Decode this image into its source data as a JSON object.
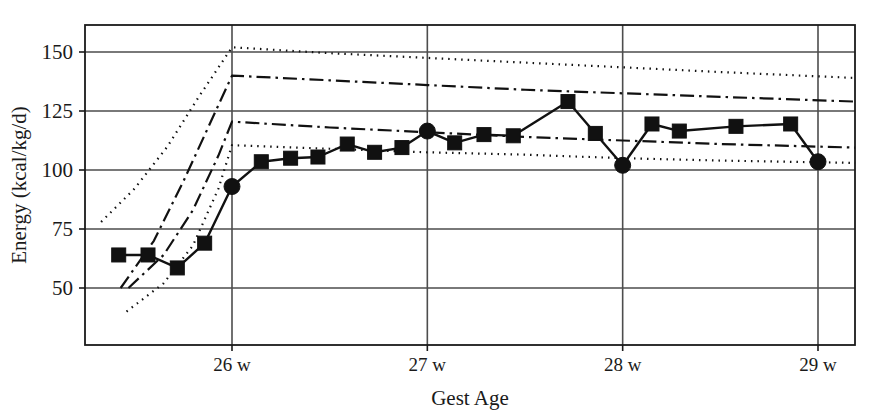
{
  "chart_data": {
    "type": "line",
    "title": "",
    "xlabel": "Gest Age",
    "ylabel": "Energy (kcal/kg/d)",
    "xlim": [
      25.25,
      29.19
    ],
    "ylim": [
      38,
      158
    ],
    "grid": true,
    "legend_position": "none",
    "x_ticks": [
      26,
      27,
      28,
      29
    ],
    "x_tick_labels": [
      "26 w",
      "27 w",
      "28 w",
      "29 w"
    ],
    "y_ticks": [
      50,
      75,
      100,
      125,
      150
    ],
    "y_tick_labels": [
      "50",
      "75",
      "100",
      "125",
      "150"
    ],
    "series": [
      {
        "name": "Measured energy intake",
        "style": "solid",
        "marker": "square-and-circle",
        "note": "circle markers fall on whole-week gridlines, squares elsewhere",
        "points": [
          {
            "x": 25.42,
            "y": 64.0,
            "marker": "square"
          },
          {
            "x": 25.57,
            "y": 64.0,
            "marker": "square"
          },
          {
            "x": 25.72,
            "y": 58.5,
            "marker": "square"
          },
          {
            "x": 25.86,
            "y": 69.0,
            "marker": "square"
          },
          {
            "x": 26.0,
            "y": 93.0,
            "marker": "circle"
          },
          {
            "x": 26.15,
            "y": 103.5,
            "marker": "square"
          },
          {
            "x": 26.3,
            "y": 105.0,
            "marker": "square"
          },
          {
            "x": 26.44,
            "y": 105.5,
            "marker": "square"
          },
          {
            "x": 26.59,
            "y": 111.0,
            "marker": "square"
          },
          {
            "x": 26.73,
            "y": 107.5,
            "marker": "square"
          },
          {
            "x": 26.87,
            "y": 109.5,
            "marker": "square"
          },
          {
            "x": 27.0,
            "y": 116.5,
            "marker": "circle"
          },
          {
            "x": 27.14,
            "y": 111.5,
            "marker": "square"
          },
          {
            "x": 27.29,
            "y": 115.0,
            "marker": "square"
          },
          {
            "x": 27.44,
            "y": 114.5,
            "marker": "square"
          },
          {
            "x": 27.72,
            "y": 129.0,
            "marker": "square"
          },
          {
            "x": 27.86,
            "y": 115.5,
            "marker": "square"
          },
          {
            "x": 28.0,
            "y": 102.0,
            "marker": "circle"
          },
          {
            "x": 28.15,
            "y": 119.5,
            "marker": "square"
          },
          {
            "x": 28.29,
            "y": 116.5,
            "marker": "square"
          },
          {
            "x": 28.58,
            "y": 118.5,
            "marker": "square"
          },
          {
            "x": 28.86,
            "y": 119.5,
            "marker": "square"
          },
          {
            "x": 29.0,
            "y": 103.5,
            "marker": "circle"
          }
        ]
      },
      {
        "name": "Upper reference (outer)",
        "style": "dotted",
        "marker": "none",
        "points": [
          {
            "x": 25.33,
            "y": 78.0
          },
          {
            "x": 25.5,
            "y": 92.0
          },
          {
            "x": 25.67,
            "y": 110.0
          },
          {
            "x": 25.83,
            "y": 131.0
          },
          {
            "x": 26.0,
            "y": 152.0
          },
          {
            "x": 26.5,
            "y": 149.5
          },
          {
            "x": 27.0,
            "y": 147.5
          },
          {
            "x": 27.5,
            "y": 145.5
          },
          {
            "x": 28.0,
            "y": 143.5
          },
          {
            "x": 28.5,
            "y": 141.5
          },
          {
            "x": 29.19,
            "y": 139.0
          }
        ]
      },
      {
        "name": "Upper reference (inner)",
        "style": "dash-dot",
        "marker": "none",
        "points": [
          {
            "x": 25.43,
            "y": 50.0
          },
          {
            "x": 25.6,
            "y": 70.0
          },
          {
            "x": 25.75,
            "y": 95.0
          },
          {
            "x": 25.9,
            "y": 122.0
          },
          {
            "x": 26.0,
            "y": 140.0
          },
          {
            "x": 26.5,
            "y": 138.0
          },
          {
            "x": 27.0,
            "y": 136.0
          },
          {
            "x": 27.5,
            "y": 134.0
          },
          {
            "x": 28.0,
            "y": 132.5
          },
          {
            "x": 28.5,
            "y": 131.0
          },
          {
            "x": 29.19,
            "y": 129.0
          }
        ]
      },
      {
        "name": "Lower reference (inner)",
        "style": "dash-dot",
        "marker": "none",
        "points": [
          {
            "x": 25.47,
            "y": 50.0
          },
          {
            "x": 25.65,
            "y": 64.0
          },
          {
            "x": 25.8,
            "y": 83.0
          },
          {
            "x": 25.93,
            "y": 106.0
          },
          {
            "x": 26.0,
            "y": 120.5
          },
          {
            "x": 26.5,
            "y": 118.0
          },
          {
            "x": 27.0,
            "y": 116.0
          },
          {
            "x": 27.5,
            "y": 114.0
          },
          {
            "x": 28.0,
            "y": 112.5
          },
          {
            "x": 28.5,
            "y": 111.0
          },
          {
            "x": 29.19,
            "y": 109.5
          }
        ]
      },
      {
        "name": "Lower reference (outer)",
        "style": "dotted",
        "marker": "none",
        "points": [
          {
            "x": 25.46,
            "y": 40.0
          },
          {
            "x": 25.65,
            "y": 52.0
          },
          {
            "x": 25.8,
            "y": 68.0
          },
          {
            "x": 25.93,
            "y": 92.0
          },
          {
            "x": 26.0,
            "y": 110.5
          },
          {
            "x": 26.5,
            "y": 109.0
          },
          {
            "x": 27.0,
            "y": 107.5
          },
          {
            "x": 27.5,
            "y": 106.5
          },
          {
            "x": 28.0,
            "y": 105.0
          },
          {
            "x": 28.5,
            "y": 104.0
          },
          {
            "x": 29.19,
            "y": 103.0
          }
        ]
      }
    ],
    "colors": {
      "line": "#111111",
      "grid": "#4d4d4d",
      "axis": "#1a1a1a",
      "background": "#ffffff"
    }
  }
}
